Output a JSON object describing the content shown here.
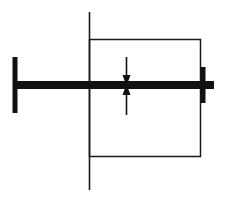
{
  "canvas": {
    "width": 225,
    "height": 201,
    "background": "#ffffff",
    "ink": "#111111",
    "thin_ink": "#1a1a1a"
  },
  "elements": {
    "vertical_centerline": {
      "name": "vertical-centerline",
      "x": 89.5,
      "y1": 12,
      "y2": 190,
      "stroke_width": 1.6,
      "color": "#1a1a1a"
    },
    "rectangle": {
      "name": "rectangle-outline",
      "x": 89.5,
      "y": 39.5,
      "width": 111,
      "height": 117,
      "stroke_width": 1.5,
      "color": "#1a1a1a",
      "fill": "none"
    },
    "beam": {
      "name": "horizontal-beam",
      "x1": 14,
      "x2": 214,
      "y": 85,
      "thickness": 8,
      "color": "#111111"
    },
    "left_flange": {
      "name": "left-end-flange",
      "x": 15,
      "y1": 57,
      "y2": 113,
      "thickness": 5,
      "color": "#111111"
    },
    "right_flange": {
      "name": "right-end-flange",
      "x": 203,
      "y1": 67,
      "y2": 103,
      "thickness": 5,
      "color": "#111111"
    },
    "arrow_down": {
      "name": "load-arrow-down",
      "x": 126.5,
      "tail_y": 57,
      "tip_y": 86,
      "stroke_width": 1.6,
      "head_half_width": 4,
      "head_length": 11,
      "color": "#111111",
      "direction": "down"
    },
    "arrow_up": {
      "name": "load-arrow-up",
      "x": 126.5,
      "tail_y": 115,
      "tip_y": 84,
      "stroke_width": 1.6,
      "head_half_width": 4,
      "head_length": 11,
      "color": "#111111",
      "direction": "up"
    }
  }
}
